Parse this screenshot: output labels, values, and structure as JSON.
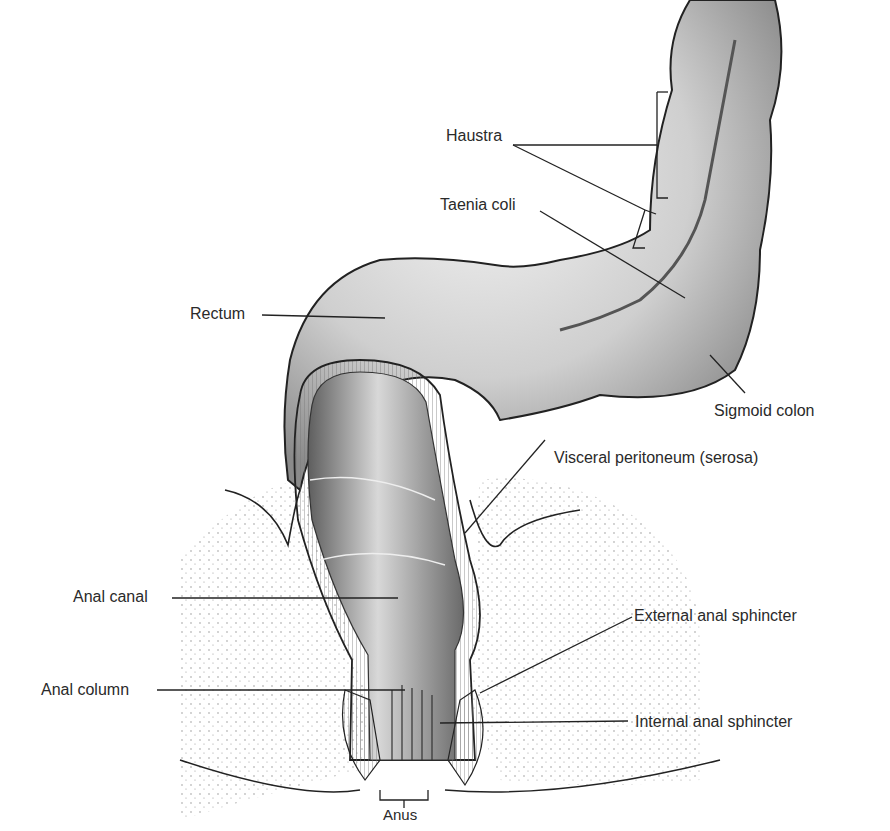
{
  "figure": {
    "labels": {
      "haustra": "Haustra",
      "taenia_coli": "Taenia coli",
      "rectum": "Rectum",
      "sigmoid_colon": "Sigmoid colon",
      "visceral_peritoneum": "Visceral peritoneum (serosa)",
      "anal_canal": "Anal canal",
      "external_anal_sphincter": "External anal sphincter",
      "anal_column": "Anal column",
      "internal_anal_sphincter": "Internal anal sphincter",
      "anus": "Anus"
    }
  }
}
